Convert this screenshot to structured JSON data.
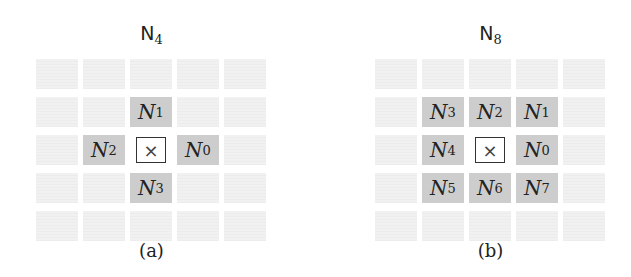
{
  "panels": [
    {
      "id": "a",
      "title_main": "N",
      "title_sub": "4",
      "caption": "(a)",
      "center_symbol": "×",
      "neighbors": [
        {
          "row": 1,
          "col": 2,
          "main": "N",
          "sub": "1"
        },
        {
          "row": 2,
          "col": 1,
          "main": "N",
          "sub": "2"
        },
        {
          "row": 2,
          "col": 3,
          "main": "N",
          "sub": "0"
        },
        {
          "row": 3,
          "col": 2,
          "main": "N",
          "sub": "3"
        }
      ]
    },
    {
      "id": "b",
      "title_main": "N",
      "title_sub": "8",
      "caption": "(b)",
      "center_symbol": "×",
      "neighbors": [
        {
          "row": 1,
          "col": 1,
          "main": "N",
          "sub": "3"
        },
        {
          "row": 1,
          "col": 2,
          "main": "N",
          "sub": "2"
        },
        {
          "row": 1,
          "col": 3,
          "main": "N",
          "sub": "1"
        },
        {
          "row": 2,
          "col": 1,
          "main": "N",
          "sub": "4"
        },
        {
          "row": 2,
          "col": 3,
          "main": "N",
          "sub": "0"
        },
        {
          "row": 3,
          "col": 1,
          "main": "N",
          "sub": "5"
        },
        {
          "row": 3,
          "col": 2,
          "main": "N",
          "sub": "6"
        },
        {
          "row": 3,
          "col": 3,
          "main": "N",
          "sub": "7"
        }
      ]
    }
  ],
  "grid": {
    "rows": 5,
    "cols": 5,
    "center_row": 2,
    "center_col": 2
  },
  "colors": {
    "neighbor_fill": "#cdcdcd",
    "background_cell": "#f1f1f1",
    "center_border": "#333333"
  }
}
